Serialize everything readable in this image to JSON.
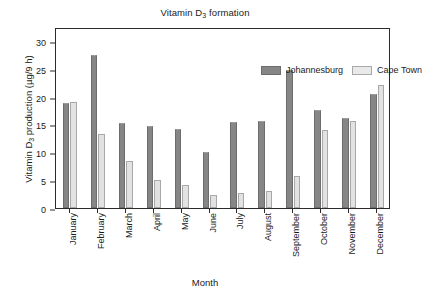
{
  "chart_data": {
    "type": "bar",
    "title": "Vitamin D3 formation",
    "title_main": "Vitamin D",
    "title_sub": "3",
    "title_tail": " formation",
    "xlabel": "Month",
    "ylabel": "Vitamin D3 production (µg/9 h)",
    "ylabel_main": "Vitamin D",
    "ylabel_sub": "3",
    "ylabel_tail": " production (µg/9 h)",
    "categories": [
      "January",
      "February",
      "March",
      "April",
      "May",
      "June",
      "July",
      "August",
      "September",
      "October",
      "November",
      "December"
    ],
    "series": [
      {
        "name": "Johannesburg",
        "color": "#868686",
        "values": [
          18.8,
          27.5,
          15.2,
          14.8,
          14.2,
          10.1,
          15.5,
          15.6,
          24.8,
          17.6,
          16.2,
          20.4
        ]
      },
      {
        "name": "Cape Town",
        "color": "#e2e2e2",
        "values": [
          19.0,
          13.3,
          8.5,
          5.0,
          4.2,
          2.3,
          2.7,
          3.0,
          5.7,
          14.0,
          15.6,
          22.0
        ]
      }
    ],
    "yticks": [
      0,
      5,
      10,
      15,
      20,
      25,
      30
    ],
    "ytick_labels": [
      "0",
      "5",
      "10",
      "15",
      "20",
      "25",
      "30"
    ],
    "ylim": [
      0,
      32.5
    ],
    "grid": false,
    "legend_position": "top-right"
  }
}
